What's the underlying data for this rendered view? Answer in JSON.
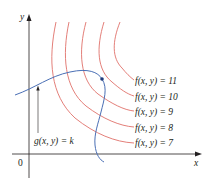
{
  "figure": {
    "axes": {
      "x_label": "x",
      "y_label": "y",
      "origin_label": "0"
    },
    "colors": {
      "level_curves": "#e0706a",
      "constraint_curve": "#4a6fb5",
      "axes": "#231f20",
      "text": "#231f20"
    },
    "level_curves": [
      {
        "label": "f(x, y) = 11",
        "value": 11
      },
      {
        "label": "f(x, y) = 10",
        "value": 10
      },
      {
        "label": "f(x, y) = 9",
        "value": 9
      },
      {
        "label": "f(x, y) = 8",
        "value": 8
      },
      {
        "label": "f(x, y) = 7",
        "value": 7
      }
    ],
    "constraint": {
      "label": "g(x, y) = k"
    },
    "tangent_point": "marked dot where g(x, y) = k touches f(x, y) = 10"
  }
}
